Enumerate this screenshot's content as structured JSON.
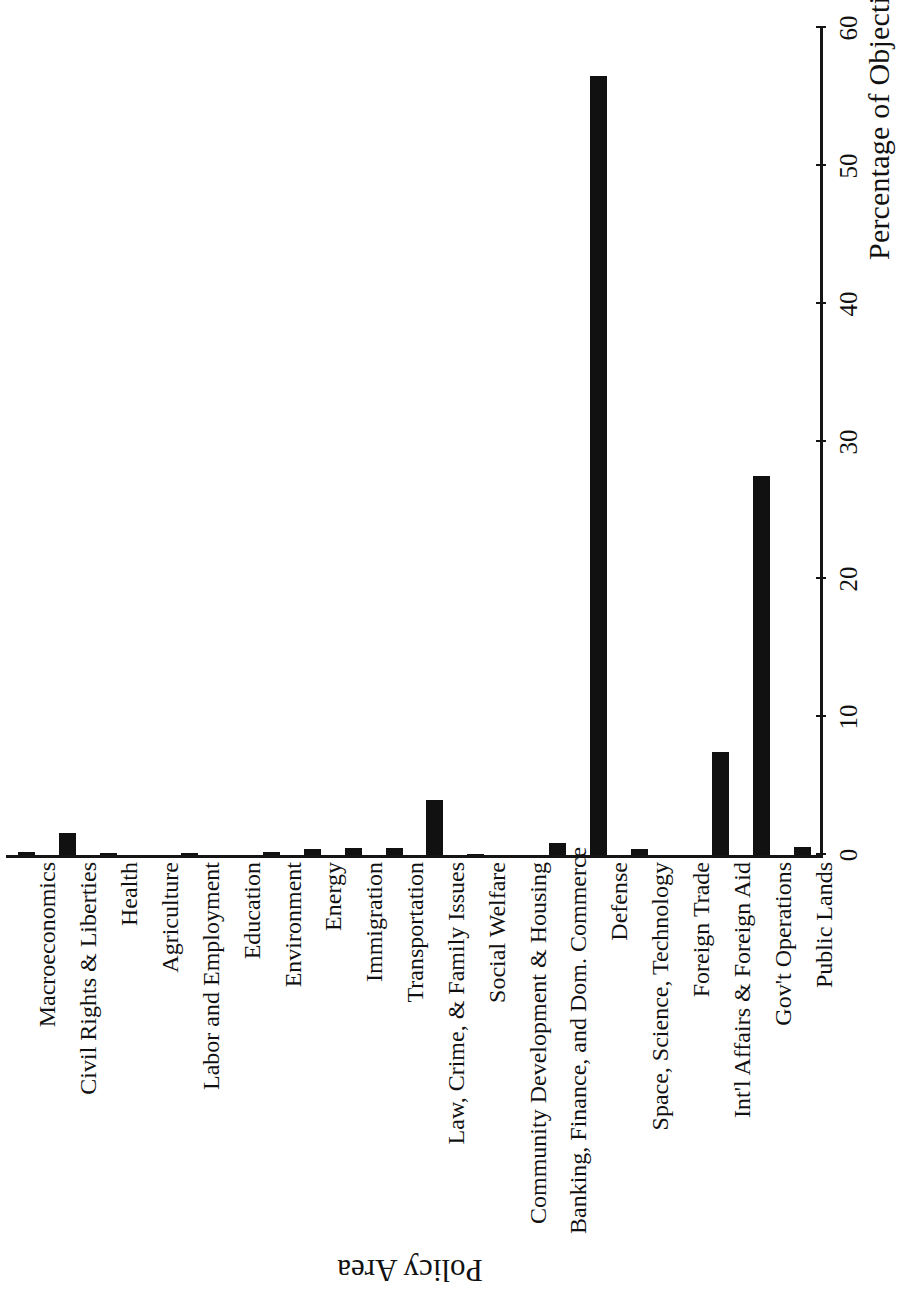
{
  "chart_data": {
    "type": "bar",
    "title": "",
    "orientation": "rotated-90",
    "xlabel": "Policy Area",
    "ylabel": "Percentage of Objections",
    "ylim": [
      0,
      60
    ],
    "yticks": [
      0,
      10,
      20,
      30,
      40,
      50,
      60
    ],
    "ytick_labels": [
      "0",
      "10",
      "20",
      "30",
      "40",
      "50",
      "60"
    ],
    "grid": false,
    "legend": null,
    "bar_color": "#111111",
    "categories": [
      "Macroeconomics",
      "Civil Rights & Liberties",
      "Health",
      "Agriculture",
      "Labor and Employment",
      "Education",
      "Environment",
      "Energy",
      "Immigration",
      "Transportation",
      "Law, Crime, & Family Issues",
      "Social Welfare",
      "Community Development & Housing",
      "Banking, Finance, and Dom. Commerce",
      "Defense",
      "Space, Science, Technology",
      "Foreign Trade",
      "Int'l Affairs & Foreign Aid",
      "Gov't Operations",
      "Public Lands"
    ],
    "values": [
      0.2,
      1.6,
      0.15,
      0.0,
      0.15,
      0.0,
      0.25,
      0.45,
      0.5,
      0.5,
      4.0,
      0.1,
      0.0,
      0.9,
      56.5,
      0.45,
      0.0,
      7.5,
      27.5,
      0.6
    ]
  }
}
